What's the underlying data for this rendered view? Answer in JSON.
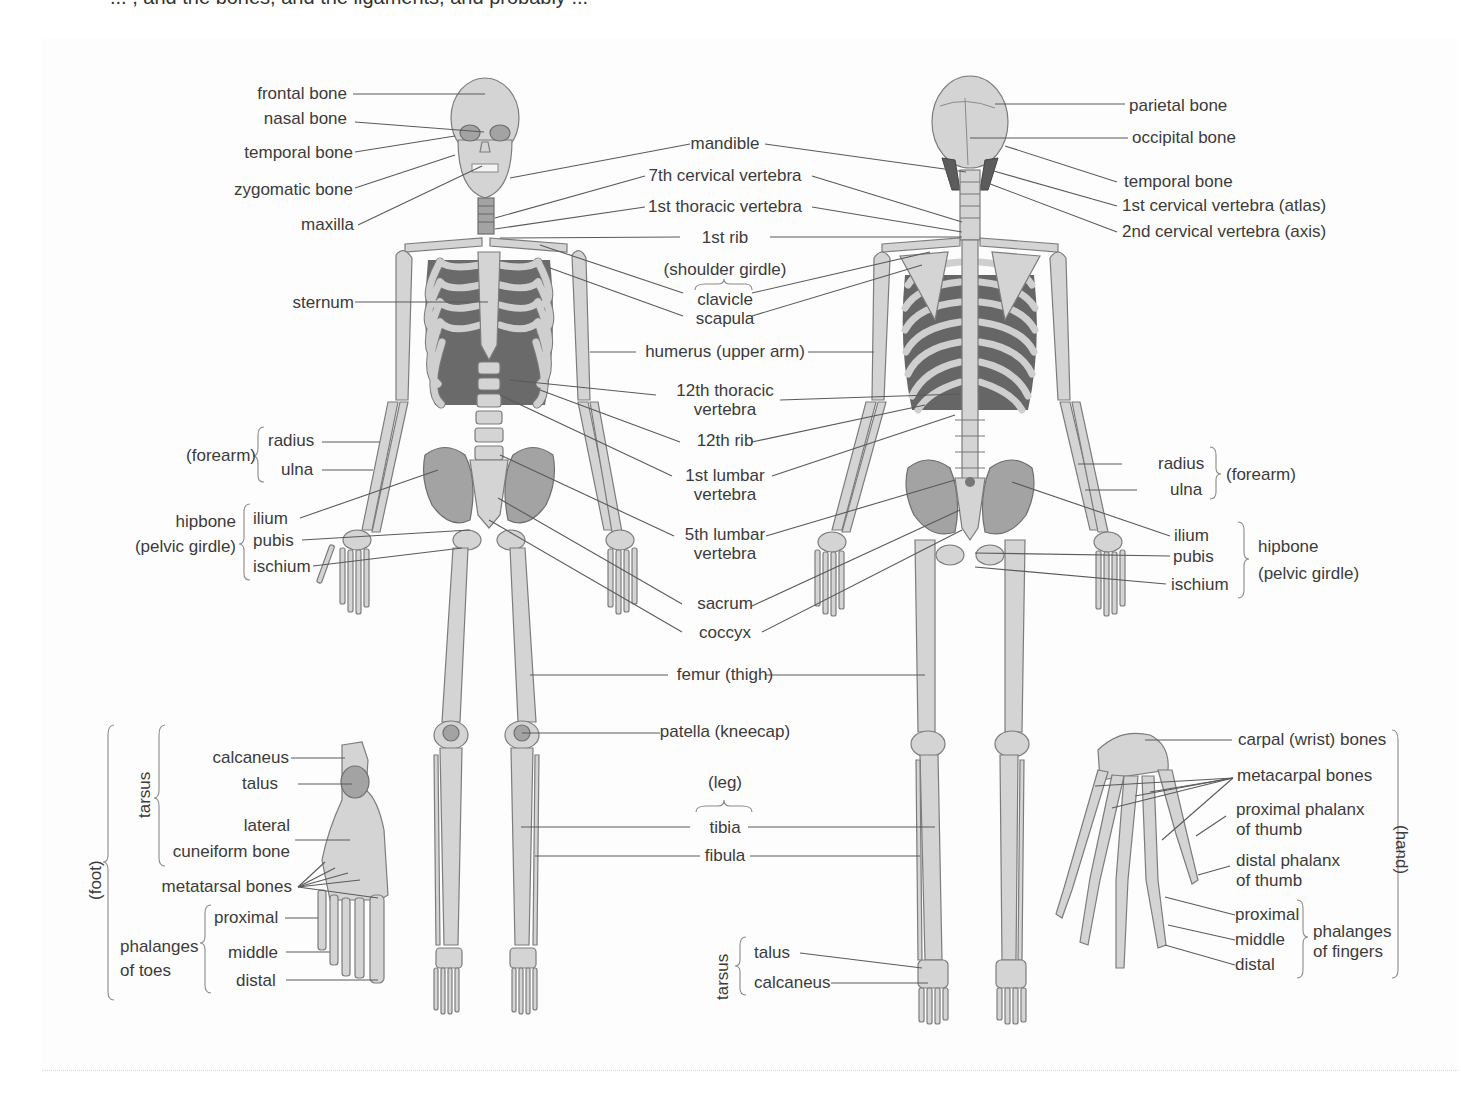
{
  "page_header_fragment": "... , and the bones, and the ligaments, and probably ...",
  "figure": {
    "colors": {
      "bone": "#d2d2d2",
      "bone_dark": "#9a9a9a",
      "bone_outline": "#7a7a7a",
      "line": "#555555",
      "text": "#3b3b3b"
    },
    "left_labels": {
      "frontal_bone": "frontal bone",
      "nasal_bone": "nasal bone",
      "temporal_bone": "temporal bone",
      "zygomatic_bone": "zygomatic bone",
      "maxilla": "maxilla",
      "sternum": "sternum",
      "forearm_group": "(forearm)",
      "radius": "radius",
      "ulna": "ulna",
      "hipbone_group_1": "hipbone",
      "hipbone_group_2": "(pelvic girdle)",
      "ilium": "ilium",
      "pubis": "pubis",
      "ischium": "ischium"
    },
    "center_labels": {
      "mandible": "mandible",
      "cervical_7": "7th cervical vertebra",
      "thoracic_1": "1st thoracic vertebra",
      "rib_1": "1st rib",
      "shoulder_girdle": "(shoulder girdle)",
      "clavicle": "clavicle",
      "scapula": "scapula",
      "humerus": "humerus (upper arm)",
      "thoracic_12_a": "12th thoracic",
      "thoracic_12_b": "vertebra",
      "rib_12": "12th rib",
      "lumbar_1_a": "1st lumbar",
      "lumbar_1_b": "vertebra",
      "lumbar_5_a": "5th lumbar",
      "lumbar_5_b": "vertebra",
      "sacrum": "sacrum",
      "coccyx": "coccyx",
      "femur": "femur (thigh)",
      "patella": "patella (kneecap)",
      "leg_group": "(leg)",
      "tibia": "tibia",
      "fibula": "fibula"
    },
    "right_labels": {
      "parietal_bone": "parietal bone",
      "occipital_bone": "occipital bone",
      "temporal_bone": "temporal bone",
      "cervical_1": "1st cervical vertebra (atlas)",
      "cervical_2": "2nd cervical vertebra (axis)",
      "radius": "radius",
      "ulna": "ulna",
      "forearm_group": "(forearm)",
      "ilium": "ilium",
      "pubis": "pubis",
      "ischium": "ischium",
      "hipbone_group_1": "hipbone",
      "hipbone_group_2": "(pelvic girdle)"
    },
    "foot_inset": {
      "group": "(foot)",
      "tarsus": "tarsus",
      "calcaneus": "calcaneus",
      "talus": "talus",
      "lateral_cuneiform_a": "lateral",
      "lateral_cuneiform_b": "cuneiform bone",
      "metatarsal": "metatarsal bones",
      "phalanges_a": "phalanges",
      "phalanges_b": "of toes",
      "proximal": "proximal",
      "middle": "middle",
      "distal": "distal"
    },
    "ankle_labels": {
      "tarsus": "tarsus",
      "talus": "talus",
      "calcaneus": "calcaneus"
    },
    "hand_inset": {
      "group": "(hand)",
      "carpal": "carpal (wrist) bones",
      "metacarpal": "metacarpal bones",
      "prox_thumb_a": "proximal phalanx",
      "prox_thumb_b": "of thumb",
      "dist_thumb_a": "distal phalanx",
      "dist_thumb_b": "of thumb",
      "proximal": "proximal",
      "middle": "middle",
      "distal": "distal",
      "phalanges_a": "phalanges",
      "phalanges_b": "of fingers"
    }
  }
}
